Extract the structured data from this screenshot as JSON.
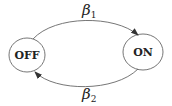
{
  "diagram": {
    "type": "state-transition",
    "states": [
      {
        "id": "off",
        "label": "OFF"
      },
      {
        "id": "on",
        "label": "ON"
      }
    ],
    "transitions": [
      {
        "from": "off",
        "to": "on",
        "symbol": "β",
        "subscript": "1"
      },
      {
        "from": "on",
        "to": "off",
        "symbol": "β",
        "subscript": "2"
      }
    ],
    "colors": {
      "stroke": "#555555",
      "text": "#222222",
      "background": "#ffffff"
    }
  }
}
